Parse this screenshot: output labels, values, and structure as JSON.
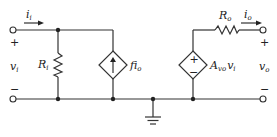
{
  "diagram": {
    "type": "two-port amplifier small-signal model",
    "input": {
      "current_label": "i",
      "current_sub": "i",
      "voltage_label": "v",
      "voltage_sub": "i",
      "plus": "+",
      "minus": "−"
    },
    "output": {
      "current_label": "i",
      "current_sub": "o",
      "voltage_label": "v",
      "voltage_sub": "o",
      "plus": "+",
      "minus": "−"
    },
    "components": {
      "input_resistor": {
        "label": "R",
        "sub": "i"
      },
      "output_resistor": {
        "label": "R",
        "sub": "o"
      },
      "current_source": {
        "label": "fi",
        "sub": "o",
        "kind": "dependent current source (arrow up)"
      },
      "voltage_source": {
        "label": "A",
        "sub": "vo",
        "suffix": "v",
        "suffix_sub": "i",
        "kind": "dependent voltage source",
        "plus": "+",
        "minus": "−"
      },
      "ground": {
        "kind": "ground-symbol"
      }
    }
  }
}
